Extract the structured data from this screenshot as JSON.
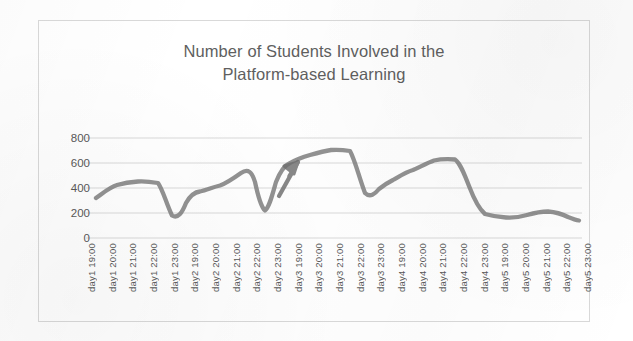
{
  "chart_data": {
    "type": "line",
    "title": "Number of Students Involved in the\nPlatform-based Learning",
    "title_line1": "Number of Students Involved in the",
    "title_line2": "Platform-based Learning",
    "xlabel": "",
    "ylabel": "",
    "ylim": [
      0,
      800
    ],
    "yticks": [
      0,
      200,
      400,
      600,
      800
    ],
    "ytick_labels": [
      "0",
      "200",
      "400",
      "600",
      "800"
    ],
    "grid": true,
    "legend": false,
    "legend_position": "none",
    "line_color": "#7f7f7f",
    "text_color": "#595959",
    "gridline_color": "#d9d9d9",
    "border_color": "#d9d9d9",
    "background_color": "#ffffff",
    "categories": [
      "day1 19:00",
      "day1 20:00",
      "day1 21:00",
      "day1 22:00",
      "day1 23:00",
      "day2 19:00",
      "day2 20:00",
      "day2 21:00",
      "day2 22:00",
      "day2 23:00",
      "day3 19:00",
      "day3 20:00",
      "day3 21:00",
      "day3 22:00",
      "day3 23:00",
      "day4 19:00",
      "day4 20:00",
      "day4 21:00",
      "day4 22:00",
      "day4 23:00",
      "day5 19:00",
      "day5 20:00",
      "day5 21:00",
      "day5 22:00",
      "day5 23:00"
    ],
    "series": [
      {
        "name": "Number of Students",
        "values": [
          320,
          420,
          450,
          440,
          180,
          370,
          420,
          470,
          530,
          220,
          600,
          650,
          690,
          710,
          320,
          430,
          520,
          600,
          630,
          420,
          170,
          165,
          210,
          215,
          140
        ]
      }
    ],
    "annotations": [
      {
        "type": "arrow",
        "name": "upward-trend-arrow",
        "points_at_category": "day3 19:00",
        "points_at_value": 600,
        "direction": "up-right"
      }
    ]
  }
}
